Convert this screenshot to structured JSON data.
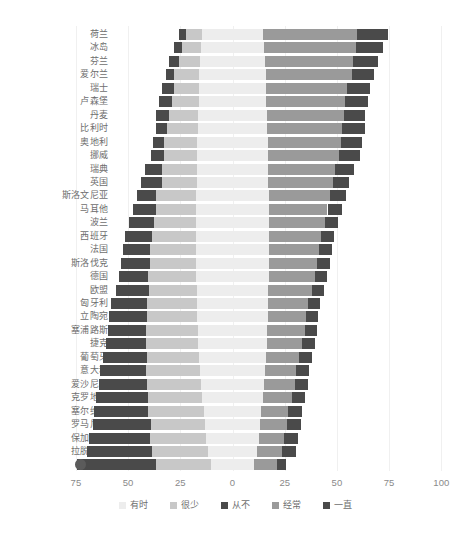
{
  "chart_data": {
    "type": "bar",
    "subtype": "diverging-stacked-bar",
    "title": "",
    "xlabel": "",
    "ylabel": "",
    "xlim": [
      -75,
      100
    ],
    "xticks": [
      -75,
      -50,
      -25,
      0,
      25,
      50,
      75,
      100
    ],
    "xticklabels": [
      "75",
      "50",
      "25",
      "0",
      "25",
      "50",
      "75",
      "100"
    ],
    "grid": true,
    "legend_position": "bottom",
    "legend": [
      "有时",
      "很少",
      "从不",
      "经常",
      "一直"
    ],
    "series_order_negative": [
      "从不",
      "很少",
      "有时"
    ],
    "series_order_positive": [
      "有时",
      "经常",
      "一直"
    ],
    "colors": {
      "有时": "#ededed",
      "很少": "#c8c8c8",
      "从不": "#4a4a4a",
      "经常": "#9a9a9a",
      "一直": "#4a4a4a"
    },
    "categories": [
      "荷兰",
      "冰岛",
      "芬兰",
      "爱尔兰",
      "瑞士",
      "卢森堡",
      "丹麦",
      "比利时",
      "奥地利",
      "挪威",
      "瑞典",
      "英国",
      "斯洛文尼亚",
      "马耳他",
      "波兰",
      "西班牙",
      "法国",
      "斯洛伐克",
      "德国",
      "欧盟",
      "匈牙利",
      "立陶宛",
      "塞浦路斯",
      "捷克",
      "葡萄牙",
      "意大利",
      "爱沙尼亚",
      "克罗地亚",
      "塞尔维亚",
      "罗马尼亚",
      "保加利亚",
      "拉脱维亚",
      "希腊"
    ],
    "series": [
      {
        "name": "从不",
        "values": [
          3,
          4,
          5,
          4,
          6,
          6,
          6,
          5,
          5,
          6,
          8,
          10,
          9,
          11,
          12,
          13,
          13,
          14,
          14,
          16,
          17,
          18,
          18,
          19,
          21,
          22,
          23,
          25,
          26,
          28,
          29,
          31,
          38
        ]
      },
      {
        "name": "很少",
        "values": [
          8,
          9,
          10,
          12,
          12,
          13,
          14,
          15,
          16,
          16,
          17,
          17,
          19,
          19,
          20,
          21,
          22,
          22,
          23,
          23,
          24,
          24,
          25,
          25,
          25,
          26,
          26,
          26,
          27,
          26,
          27,
          27,
          26
        ]
      },
      {
        "name": "有时",
        "values": [
          29,
          30,
          31,
          32,
          32,
          32,
          33,
          33,
          34,
          34,
          34,
          34,
          35,
          35,
          35,
          35,
          35,
          35,
          35,
          34,
          34,
          34,
          33,
          33,
          32,
          31,
          30,
          29,
          27,
          26,
          25,
          23,
          21
        ]
      },
      {
        "name": "经常",
        "values": [
          45,
          44,
          42,
          41,
          39,
          38,
          37,
          36,
          35,
          34,
          32,
          31,
          29,
          28,
          27,
          25,
          24,
          23,
          22,
          21,
          19,
          18,
          18,
          17,
          16,
          15,
          15,
          14,
          13,
          13,
          12,
          12,
          11
        ]
      },
      {
        "name": "一直",
        "values": [
          15,
          13,
          12,
          11,
          11,
          11,
          10,
          11,
          10,
          10,
          9,
          8,
          8,
          7,
          6,
          6,
          6,
          6,
          6,
          6,
          6,
          6,
          6,
          6,
          6,
          6,
          6,
          6,
          7,
          7,
          7,
          7,
          4
        ]
      }
    ]
  },
  "axis": {
    "ticks": [
      {
        "label": "75",
        "value": -75
      },
      {
        "label": "50",
        "value": -50
      },
      {
        "label": "25",
        "value": -25
      },
      {
        "label": "0",
        "value": 0
      },
      {
        "label": "25",
        "value": 25
      },
      {
        "label": "50",
        "value": 50
      },
      {
        "label": "75",
        "value": 75
      },
      {
        "label": "100",
        "value": 100
      }
    ]
  },
  "marker": {
    "name": "reference-dot",
    "value": -73,
    "row": 32
  }
}
